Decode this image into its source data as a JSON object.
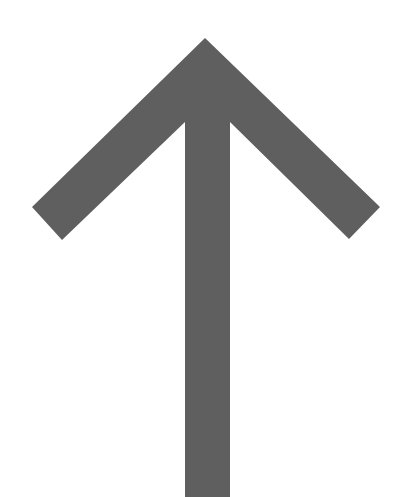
{
  "image": {
    "description": "Large upward-pointing arrow",
    "icon": "arrow-up-icon",
    "background": "#ffffff",
    "arrow_color": "#5f5f5f"
  }
}
